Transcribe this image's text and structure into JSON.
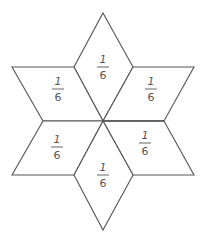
{
  "figure": {
    "type": "hexagram-fraction-diagram",
    "line_color": "#555555",
    "background": "#ffffff",
    "center": [
      103,
      121
    ],
    "pieces": [
      {
        "id": "top",
        "numerator": "1",
        "denominator": "6",
        "label_x": 103,
        "label_bar_y": 67,
        "points": [
          [
            103,
            13
          ],
          [
            133,
            67
          ],
          [
            103,
            121
          ],
          [
            74,
            67
          ]
        ]
      },
      {
        "id": "upper-left",
        "numerator": "1",
        "denominator": "6",
        "label_x": 58,
        "label_bar_y": 89,
        "points": [
          [
            12,
            67
          ],
          [
            74,
            67
          ],
          [
            103,
            121
          ],
          [
            43,
            121
          ]
        ]
      },
      {
        "id": "upper-right",
        "numerator": "1",
        "denominator": "6",
        "label_x": 151,
        "label_bar_y": 89,
        "points": [
          [
            133,
            67
          ],
          [
            194,
            67
          ],
          [
            164,
            121
          ],
          [
            103,
            121
          ]
        ]
      },
      {
        "id": "lower-left",
        "numerator": "1",
        "denominator": "6",
        "label_x": 57,
        "label_bar_y": 147,
        "points": [
          [
            43,
            121
          ],
          [
            103,
            121
          ],
          [
            74,
            175
          ],
          [
            12,
            175
          ]
        ]
      },
      {
        "id": "lower-right",
        "numerator": "1",
        "denominator": "6",
        "label_x": 145,
        "label_bar_y": 143,
        "points": [
          [
            103,
            121
          ],
          [
            164,
            121
          ],
          [
            194,
            175
          ],
          [
            133,
            175
          ]
        ]
      },
      {
        "id": "bottom",
        "numerator": "1",
        "denominator": "6",
        "label_x": 103,
        "label_bar_y": 175,
        "points": [
          [
            103,
            121
          ],
          [
            133,
            175
          ],
          [
            103,
            230
          ],
          [
            74,
            175
          ]
        ]
      }
    ]
  },
  "labels": {
    "top": {
      "numerator": "1",
      "denominator": "6"
    },
    "upper_left": {
      "numerator": "1",
      "denominator": "6"
    },
    "upper_right": {
      "numerator": "1",
      "denominator": "6"
    },
    "lower_left": {
      "numerator": "1",
      "denominator": "6"
    },
    "lower_right": {
      "numerator": "1",
      "denominator": "6"
    },
    "bottom": {
      "numerator": "1",
      "denominator": "6"
    }
  }
}
